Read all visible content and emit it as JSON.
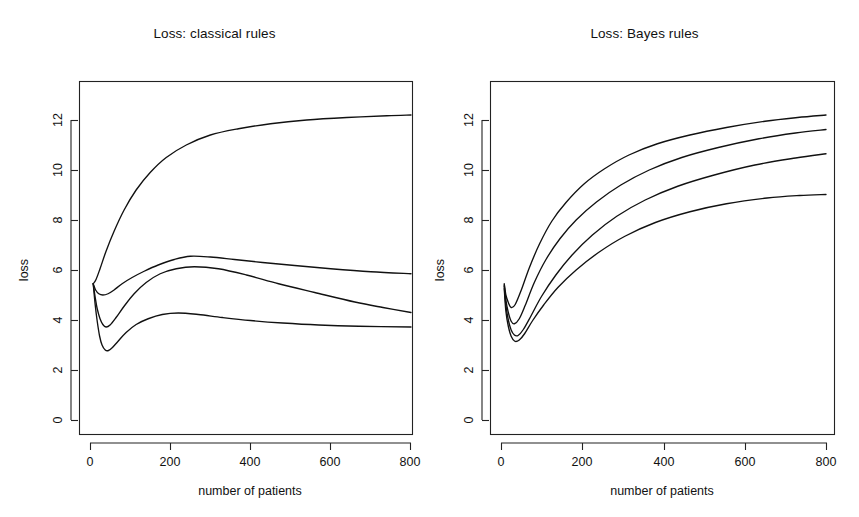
{
  "figure": {
    "panels": [
      {
        "id": "classical",
        "title": "Loss: classical rules",
        "xlabel": "number of patients",
        "ylabel": "loss"
      },
      {
        "id": "bayes",
        "title": "Loss: Bayes rules",
        "xlabel": "number of patients",
        "ylabel": "loss"
      }
    ]
  },
  "chart_data": [
    {
      "type": "line",
      "title": "Loss: classical rules",
      "xlabel": "number of patients",
      "ylabel": "loss",
      "xlim": [
        0,
        840
      ],
      "ylim": [
        0,
        13.3
      ],
      "xticks": [
        0,
        200,
        400,
        600,
        800
      ],
      "yticks": [
        0,
        2,
        4,
        6,
        8,
        10,
        12
      ],
      "xticklabels": [
        "0",
        "200",
        "400",
        "600",
        "800"
      ],
      "yticklabels": [
        "0",
        "2",
        "4",
        "6",
        "8",
        "10",
        "12"
      ],
      "grid": false,
      "legend": false,
      "series": [
        {
          "name": "curve-1-upper",
          "x": [
            8,
            15,
            25,
            40,
            60,
            85,
            115,
            150,
            190,
            240,
            300,
            370,
            450,
            540,
            640,
            740,
            800
          ],
          "y": [
            5.45,
            5.62,
            6.05,
            6.75,
            7.55,
            8.4,
            9.2,
            9.9,
            10.5,
            11.0,
            11.4,
            11.65,
            11.85,
            12.0,
            12.1,
            12.17,
            12.2
          ]
        },
        {
          "name": "curve-2",
          "x": [
            8,
            14,
            22,
            32,
            45,
            60,
            80,
            105,
            135,
            170,
            210,
            250,
            300,
            360,
            430,
            510,
            600,
            700,
            800
          ],
          "y": [
            5.45,
            5.2,
            5.05,
            5.0,
            5.05,
            5.2,
            5.45,
            5.7,
            5.95,
            6.2,
            6.42,
            6.55,
            6.52,
            6.42,
            6.3,
            6.18,
            6.05,
            5.93,
            5.85
          ]
        },
        {
          "name": "curve-3",
          "x": [
            8,
            13,
            18,
            25,
            32,
            40,
            50,
            65,
            85,
            110,
            140,
            175,
            215,
            260,
            320,
            390,
            470,
            560,
            660,
            730,
            800
          ],
          "y": [
            5.45,
            4.9,
            4.45,
            4.05,
            3.82,
            3.72,
            3.8,
            4.1,
            4.55,
            5.05,
            5.5,
            5.85,
            6.05,
            6.13,
            6.05,
            5.8,
            5.45,
            5.1,
            4.72,
            4.5,
            4.3
          ]
        },
        {
          "name": "curve-4-lower",
          "x": [
            8,
            13,
            18,
            24,
            30,
            38,
            46,
            56,
            70,
            90,
            115,
            145,
            180,
            220,
            270,
            330,
            400,
            480,
            570,
            670,
            800
          ],
          "y": [
            5.45,
            4.6,
            3.95,
            3.35,
            3.0,
            2.8,
            2.78,
            2.9,
            3.15,
            3.5,
            3.82,
            4.05,
            4.22,
            4.28,
            4.22,
            4.1,
            3.98,
            3.88,
            3.8,
            3.75,
            3.72
          ]
        }
      ]
    },
    {
      "type": "line",
      "title": "Loss: Bayes rules",
      "xlabel": "number of patients",
      "ylabel": "loss",
      "xlim": [
        0,
        840
      ],
      "ylim": [
        0,
        13.3
      ],
      "xticks": [
        0,
        200,
        400,
        600,
        800
      ],
      "yticks": [
        0,
        2,
        4,
        6,
        8,
        10,
        12
      ],
      "xticklabels": [
        "0",
        "200",
        "400",
        "600",
        "800"
      ],
      "yticklabels": [
        "0",
        "2",
        "4",
        "6",
        "8",
        "10",
        "12"
      ],
      "grid": false,
      "legend": false,
      "series": [
        {
          "name": "curve-1-upper",
          "x": [
            8,
            12,
            18,
            25,
            35,
            50,
            70,
            95,
            125,
            160,
            205,
            255,
            315,
            385,
            465,
            555,
            650,
            730,
            800
          ],
          "y": [
            5.45,
            5.0,
            4.7,
            4.5,
            4.62,
            5.2,
            6.1,
            7.05,
            7.95,
            8.7,
            9.45,
            10.05,
            10.6,
            11.05,
            11.4,
            11.7,
            11.95,
            12.1,
            12.2
          ]
        },
        {
          "name": "curve-2",
          "x": [
            8,
            12,
            18,
            25,
            33,
            45,
            60,
            82,
            110,
            145,
            185,
            235,
            295,
            365,
            445,
            535,
            635,
            725,
            800
          ],
          "y": [
            5.4,
            4.8,
            4.3,
            3.95,
            3.85,
            4.05,
            4.6,
            5.5,
            6.4,
            7.25,
            8.0,
            8.72,
            9.4,
            10.0,
            10.5,
            10.9,
            11.25,
            11.48,
            11.62
          ]
        },
        {
          "name": "curve-3",
          "x": [
            8,
            12,
            18,
            25,
            33,
            42,
            55,
            75,
            100,
            135,
            175,
            225,
            285,
            355,
            435,
            525,
            625,
            725,
            800
          ],
          "y": [
            5.35,
            4.6,
            4.0,
            3.6,
            3.4,
            3.38,
            3.62,
            4.2,
            4.95,
            5.8,
            6.6,
            7.4,
            8.15,
            8.8,
            9.35,
            9.8,
            10.2,
            10.48,
            10.65
          ]
        },
        {
          "name": "curve-4-lower",
          "x": [
            8,
            12,
            18,
            25,
            34,
            45,
            58,
            78,
            105,
            140,
            185,
            240,
            305,
            380,
            465,
            555,
            655,
            735,
            800
          ],
          "y": [
            5.25,
            4.35,
            3.75,
            3.35,
            3.15,
            3.2,
            3.45,
            3.98,
            4.6,
            5.3,
            6.0,
            6.7,
            7.35,
            7.9,
            8.33,
            8.65,
            8.88,
            8.98,
            9.02
          ]
        }
      ]
    }
  ],
  "style": {
    "background": "#ffffff",
    "line_color": "#111111",
    "axis_color": "#222222"
  }
}
